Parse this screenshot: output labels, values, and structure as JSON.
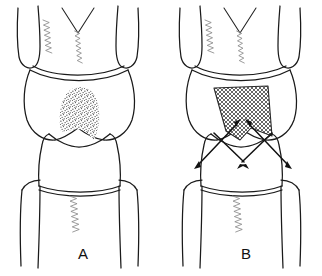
{
  "figure": {
    "background_color": "#ffffff",
    "ink_color": "#1a1a1a",
    "hatch_color": "#4a4a4a",
    "stipple_color": "#3a3a3a",
    "zigzag_color": "#8a8a8a",
    "panels": [
      {
        "id": "panel-a",
        "label": "A",
        "label_x": 83,
        "label_y": 259,
        "marked_region": "stippled",
        "arrows": []
      },
      {
        "id": "panel-b",
        "label": "B",
        "label_x": 246,
        "label_y": 259,
        "marked_region": "cross-hatched",
        "arrows": [
          {
            "name": "left-double-arrow",
            "x1": 198,
            "y1": 163,
            "x2": 236,
            "y2": 124
          },
          {
            "name": "right-double-arrow",
            "x1": 288,
            "y1": 163,
            "x2": 250,
            "y2": 124
          }
        ]
      }
    ],
    "zigzag_marks": [
      {
        "name": "upper-left-zigzag-a",
        "x": 46,
        "y": 20,
        "height": 33,
        "amp": 3.0,
        "steps": 13
      },
      {
        "name": "median-zigzag-a",
        "x": 77,
        "y": 31,
        "height": 32,
        "amp": 2.4,
        "steps": 13
      },
      {
        "name": "lower-zigzag-a",
        "x": 73,
        "y": 196,
        "height": 36,
        "amp": 3.4,
        "steps": 14
      },
      {
        "name": "upper-left-zigzag-b",
        "x": 208,
        "y": 20,
        "height": 33,
        "amp": 3.0,
        "steps": 13
      },
      {
        "name": "median-zigzag-b",
        "x": 239,
        "y": 31,
        "height": 32,
        "amp": 2.4,
        "steps": 13
      },
      {
        "name": "lower-zigzag-b",
        "x": 236,
        "y": 196,
        "height": 36,
        "amp": 3.4,
        "steps": 14
      }
    ]
  }
}
